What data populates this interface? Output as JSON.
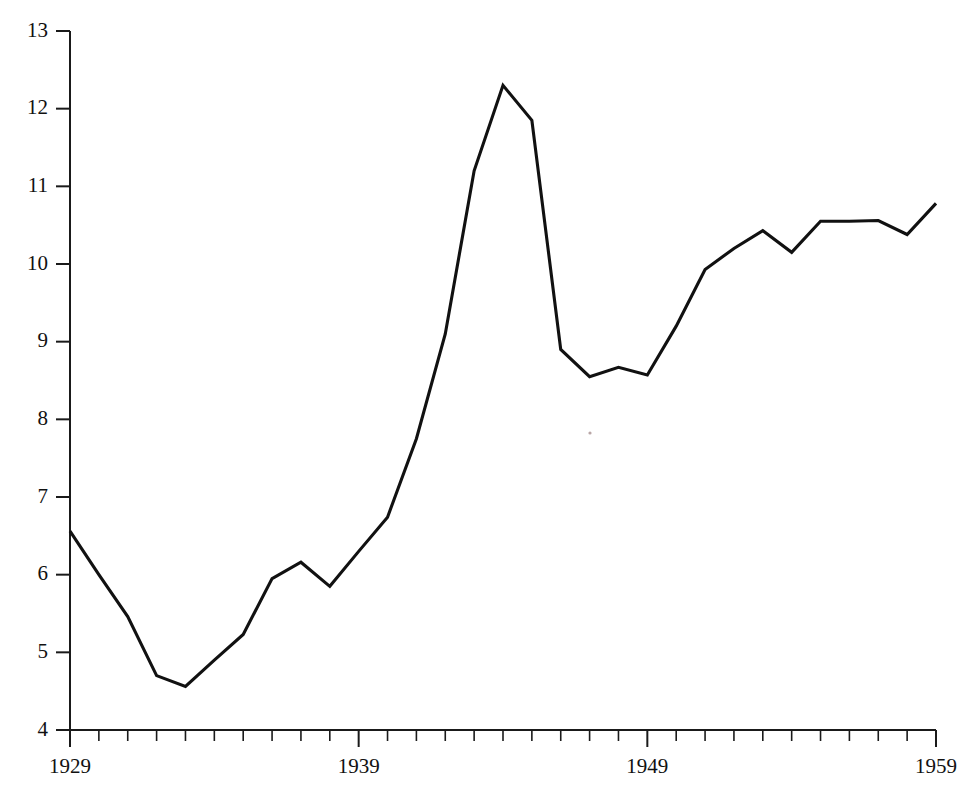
{
  "chart_data": {
    "type": "line",
    "title": "",
    "subtitle": "",
    "xlabel": "",
    "ylabel": "",
    "grid": false,
    "legend": false,
    "xlim": [
      1929,
      1959
    ],
    "ylim": [
      4,
      13
    ],
    "y_ticks": [
      4,
      5,
      6,
      7,
      8,
      9,
      10,
      11,
      12,
      13
    ],
    "y_tick_labels": [
      "4",
      "5",
      "6",
      "7",
      "8",
      "9",
      "10",
      "11",
      "12",
      "13"
    ],
    "x_ticks": [
      1929,
      1930,
      1931,
      1932,
      1933,
      1934,
      1935,
      1936,
      1937,
      1938,
      1939,
      1940,
      1941,
      1942,
      1943,
      1944,
      1945,
      1946,
      1947,
      1948,
      1949,
      1950,
      1951,
      1952,
      1953,
      1954,
      1955,
      1956,
      1957,
      1958,
      1959
    ],
    "x_tick_labels_shown": [
      "1929",
      "1939",
      "1949",
      "1959"
    ],
    "x_labeled_ticks": [
      1929,
      1939,
      1949,
      1959
    ],
    "line_color": "#111111",
    "axis_color": "#1a1a1a",
    "background_color": "#ffffff",
    "x": [
      1929,
      1930,
      1931,
      1932,
      1933,
      1934,
      1935,
      1936,
      1937,
      1938,
      1939,
      1940,
      1941,
      1942,
      1943,
      1944,
      1945,
      1946,
      1947,
      1948,
      1949,
      1950,
      1951,
      1952,
      1953,
      1954,
      1955,
      1956,
      1957,
      1958,
      1959
    ],
    "values": [
      6.56,
      6.0,
      5.46,
      4.7,
      4.56,
      4.9,
      5.23,
      5.95,
      6.16,
      5.85,
      6.3,
      6.74,
      7.75,
      9.1,
      11.2,
      12.3,
      11.85,
      8.9,
      8.55,
      8.67,
      8.57,
      9.2,
      9.93,
      10.2,
      10.43,
      10.15,
      10.55,
      10.55,
      10.56,
      10.38,
      10.78
    ],
    "series": [
      {
        "name": "value",
        "values": [
          6.56,
          6.0,
          5.46,
          4.7,
          4.56,
          4.9,
          5.23,
          5.95,
          6.16,
          5.85,
          6.3,
          6.74,
          7.75,
          9.1,
          11.2,
          12.3,
          11.85,
          8.9,
          8.55,
          8.67,
          8.57,
          9.2,
          9.93,
          10.2,
          10.43,
          10.15,
          10.55,
          10.55,
          10.56,
          10.38,
          10.78
        ]
      }
    ]
  },
  "axis": {
    "y_labels": [
      "13",
      "12",
      "11",
      "10",
      "9",
      "8",
      "7",
      "6",
      "5",
      "4"
    ],
    "x_labels": [
      {
        "text": "1929",
        "year": 1929
      },
      {
        "text": "1939",
        "year": 1939
      },
      {
        "text": "1949",
        "year": 1949
      },
      {
        "text": "1959",
        "year": 1959
      }
    ]
  }
}
